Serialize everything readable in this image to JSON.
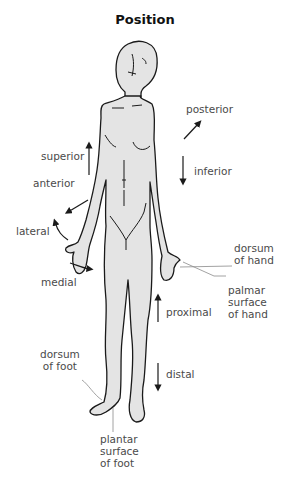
{
  "title": "Position",
  "labels": {
    "superior": "superior",
    "posterior": "posterior",
    "inferior": "inferior",
    "anterior": "anterior",
    "lateral": "lateral",
    "medial": "medial",
    "dorsum_hand_1": "dorsum",
    "dorsum_hand_2": "of hand",
    "palmar_1": "palmar",
    "palmar_2": "surface",
    "palmar_3": "of hand",
    "proximal": "proximal",
    "distal": "distal",
    "dorsum_foot_1": "dorsum",
    "dorsum_foot_2": "of foot",
    "plantar_1": "plantar",
    "plantar_2": "surface",
    "plantar_3": "of foot"
  },
  "colors": {
    "body_fill": "#e4e4e4",
    "outline": "#1a1a1a",
    "label_text": "#4a4a4a",
    "leader_line": "#8a8a8a"
  }
}
